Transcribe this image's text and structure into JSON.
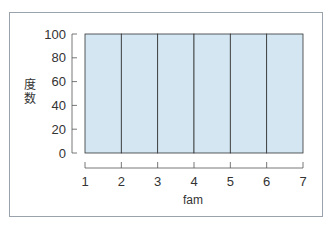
{
  "chart_data": {
    "type": "bar",
    "subtype": "histogram",
    "title": "",
    "xlabel": "fam",
    "ylabel": "度数",
    "bins": [
      {
        "from": 1,
        "to": 2,
        "value": 100
      },
      {
        "from": 2,
        "to": 3,
        "value": 100
      },
      {
        "from": 3,
        "to": 4,
        "value": 100
      },
      {
        "from": 4,
        "to": 5,
        "value": 100
      },
      {
        "from": 5,
        "to": 6,
        "value": 100
      },
      {
        "from": 6,
        "to": 7,
        "value": 100
      }
    ],
    "categories": [
      "1-2",
      "2-3",
      "3-4",
      "4-5",
      "5-6",
      "6-7"
    ],
    "values": [
      100,
      100,
      100,
      100,
      100,
      100
    ],
    "xticks": [
      "1",
      "2",
      "3",
      "4",
      "5",
      "6",
      "7"
    ],
    "yticks": [
      "0",
      "20",
      "40",
      "60",
      "80",
      "100"
    ],
    "ylim": [
      0,
      100
    ],
    "xlim": [
      1,
      7
    ],
    "grid": false,
    "legend": null,
    "colors": {
      "bar_fill": "#d3e6f2",
      "bar_stroke": "#333333",
      "frame": "#9aa3ab"
    }
  }
}
